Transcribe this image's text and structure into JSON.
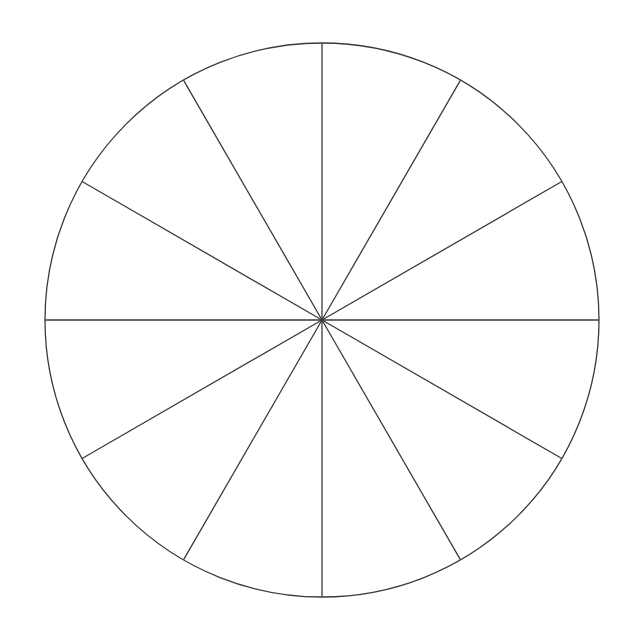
{
  "figure": {
    "background_color": "#ffffff",
    "stroke_color": "#3a3a3a",
    "fill_color": "#ffffff",
    "stroke_width": 1.3,
    "canvas": {
      "width": 624,
      "height": 635
    }
  },
  "circle": {
    "name": "fraction-circle",
    "center_x": 322,
    "center_y": 320,
    "radius": 277,
    "sector_count": 12,
    "sector_angle_degrees": 30,
    "fraction_per_sector": "1/12"
  },
  "dividers": [
    {
      "label": "0°",
      "angle": 0
    },
    {
      "label": "30°",
      "angle": 30
    },
    {
      "label": "60°",
      "angle": 60
    },
    {
      "label": "90°",
      "angle": 90
    },
    {
      "label": "120°",
      "angle": 120
    },
    {
      "label": "150°",
      "angle": 150
    },
    {
      "label": "180°",
      "angle": 180
    },
    {
      "label": "210°",
      "angle": 210
    },
    {
      "label": "240°",
      "angle": 240
    },
    {
      "label": "270°",
      "angle": 270
    },
    {
      "label": "300°",
      "angle": 300
    },
    {
      "label": "330°",
      "angle": 330
    }
  ],
  "sectors": [
    {
      "label": "sector-1",
      "start_angle": 60,
      "end_angle": 90,
      "shaded": false
    },
    {
      "label": "sector-2",
      "start_angle": 30,
      "end_angle": 60,
      "shaded": false
    },
    {
      "label": "sector-3",
      "start_angle": 0,
      "end_angle": 30,
      "shaded": false
    },
    {
      "label": "sector-4",
      "start_angle": 330,
      "end_angle": 360,
      "shaded": false
    },
    {
      "label": "sector-5",
      "start_angle": 300,
      "end_angle": 330,
      "shaded": false
    },
    {
      "label": "sector-6",
      "start_angle": 270,
      "end_angle": 300,
      "shaded": false
    },
    {
      "label": "sector-7",
      "start_angle": 240,
      "end_angle": 270,
      "shaded": false
    },
    {
      "label": "sector-8",
      "start_angle": 210,
      "end_angle": 240,
      "shaded": false
    },
    {
      "label": "sector-9",
      "start_angle": 180,
      "end_angle": 210,
      "shaded": false
    },
    {
      "label": "sector-10",
      "start_angle": 150,
      "end_angle": 180,
      "shaded": false
    },
    {
      "label": "sector-11",
      "start_angle": 120,
      "end_angle": 150,
      "shaded": false
    },
    {
      "label": "sector-12",
      "start_angle": 90,
      "end_angle": 120,
      "shaded": false
    }
  ]
}
